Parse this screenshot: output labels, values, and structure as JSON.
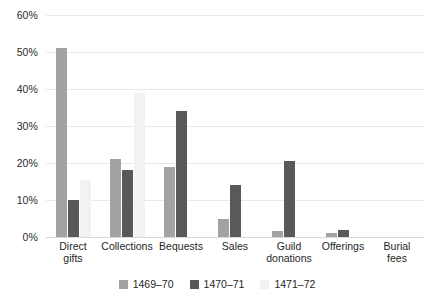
{
  "chart_data": {
    "type": "bar",
    "title": "",
    "subtitle": "",
    "xlabel": "",
    "ylabel": "",
    "ylim": [
      0,
      60
    ],
    "ytick_labels": [
      "0%",
      "10%",
      "20%",
      "30%",
      "40%",
      "50%",
      "60%"
    ],
    "ytick_values": [
      0,
      10,
      20,
      30,
      40,
      50,
      60
    ],
    "grid": true,
    "legend_position": "bottom",
    "categories": [
      "Direct gifts",
      "Collections",
      "Bequests",
      "Sales",
      "Guild donations",
      "Offerings",
      "Burial fees"
    ],
    "category_lines": [
      [
        "Direct",
        "gifts"
      ],
      [
        "Collections"
      ],
      [
        "Bequests"
      ],
      [
        "Sales"
      ],
      [
        "Guild",
        "donations"
      ],
      [
        "Offerings"
      ],
      [
        "Burial",
        "fees"
      ]
    ],
    "series": [
      {
        "name": "1469–70",
        "color": "#a3a3a3",
        "values": [
          51,
          21,
          19,
          5,
          1.5,
          1,
          0
        ]
      },
      {
        "name": "1470–71",
        "color": "#595959",
        "values": [
          10,
          18,
          34,
          14,
          20.5,
          2,
          0
        ]
      },
      {
        "name": "1471–72",
        "color": "#f2f2f2",
        "values": [
          15.5,
          39,
          0,
          0,
          0,
          0,
          0
        ]
      }
    ]
  },
  "axis": {
    "y_labels": [
      "60%",
      "50%",
      "40%",
      "30%",
      "20%",
      "10%",
      "0%"
    ]
  },
  "legend": {
    "items": [
      {
        "label": "1469–70",
        "color": "#a3a3a3"
      },
      {
        "label": "1470–71",
        "color": "#595959"
      },
      {
        "label": "1471–72",
        "color": "#f2f2f2"
      }
    ]
  }
}
